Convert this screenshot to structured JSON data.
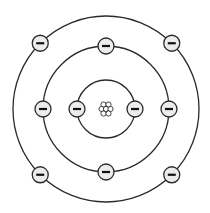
{
  "diagram": {
    "type": "bohr-atom-model",
    "center": {
      "x": 106,
      "y": 109
    },
    "colors": {
      "stroke": "#2a2a2a",
      "electron_fill": "#ececec",
      "background": "#ffffff"
    },
    "nucleus": {
      "particles": [
        {
          "dx": -2.5,
          "dy": -4.5
        },
        {
          "dx": 2.5,
          "dy": -4.5
        },
        {
          "dx": -4.5,
          "dy": 0
        },
        {
          "dx": 0,
          "dy": 0
        },
        {
          "dx": 4.5,
          "dy": 0
        },
        {
          "dx": -2.5,
          "dy": 4.5
        },
        {
          "dx": 2.5,
          "dy": 4.5
        }
      ],
      "particle_radius": 2.6
    },
    "electron_symbol": "−",
    "electron_radius": 8,
    "shells": [
      {
        "name": "shell-1",
        "radius": 29,
        "electron_angles_deg": [
          180,
          0
        ]
      },
      {
        "name": "shell-2",
        "radius": 63,
        "electron_angles_deg": [
          90,
          0,
          270,
          180
        ]
      },
      {
        "name": "shell-3",
        "radius": 93,
        "electron_angles_deg": [
          135,
          45,
          225,
          315
        ]
      }
    ]
  }
}
